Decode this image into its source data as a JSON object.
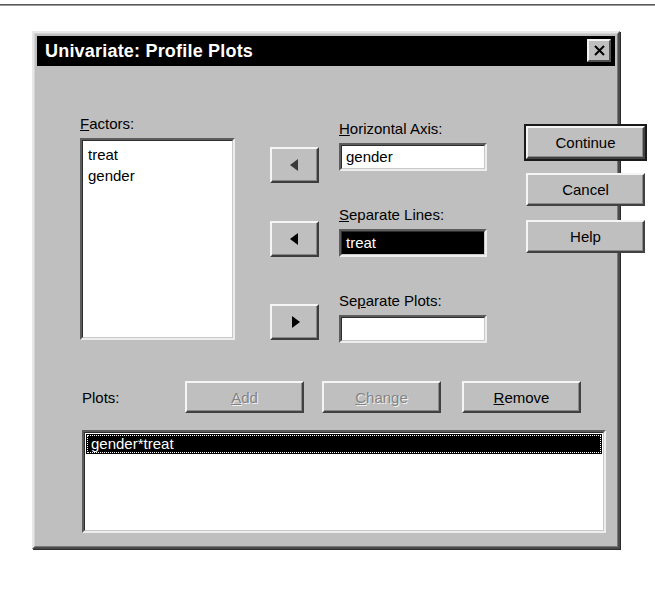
{
  "dialog": {
    "title": "Univariate: Profile Plots",
    "close_icon": "close-x-icon"
  },
  "factors": {
    "label": "Factors:",
    "label_accel": "F",
    "items": [
      "treat",
      "gender"
    ]
  },
  "transfer_buttons": [
    {
      "name": "arrow-to-horizontal",
      "glyph": "◄",
      "direction": "left",
      "state": "disabled"
    },
    {
      "name": "arrow-to-lines",
      "glyph": "◄",
      "direction": "left",
      "state": "enabled"
    },
    {
      "name": "arrow-to-plots",
      "glyph": "►",
      "direction": "right",
      "state": "enabled"
    }
  ],
  "fields": {
    "horizontal_axis": {
      "label": "Horizontal Axis:",
      "label_accel": "H",
      "value": "gender",
      "focused": false
    },
    "separate_lines": {
      "label": "Separate Lines:",
      "label_accel": "S",
      "value": "treat",
      "focused": true
    },
    "separate_plots": {
      "label": "Separate Plots:",
      "label_accel": "p",
      "value": "",
      "focused": false
    }
  },
  "action_buttons": {
    "continue": {
      "label": "Continue",
      "default": true
    },
    "cancel": {
      "label": "Cancel"
    },
    "help": {
      "label": "Help"
    }
  },
  "plots": {
    "label": "Plots:",
    "add": {
      "label": "Add",
      "accel": "A",
      "state": "disabled"
    },
    "change": {
      "label": "Change",
      "accel": "C",
      "state": "disabled"
    },
    "remove": {
      "label": "Remove",
      "accel": "R",
      "state": "enabled"
    },
    "items": [
      "gender*treat"
    ],
    "selected_index": 0
  },
  "colors": {
    "dialog_face": "#bfbfbf",
    "titlebar": "#000000",
    "titlebar_text": "#ffffff",
    "field_bg": "#ffffff",
    "selection_bg": "#000000",
    "selection_text": "#ffffff",
    "disabled_text": "#848484"
  }
}
